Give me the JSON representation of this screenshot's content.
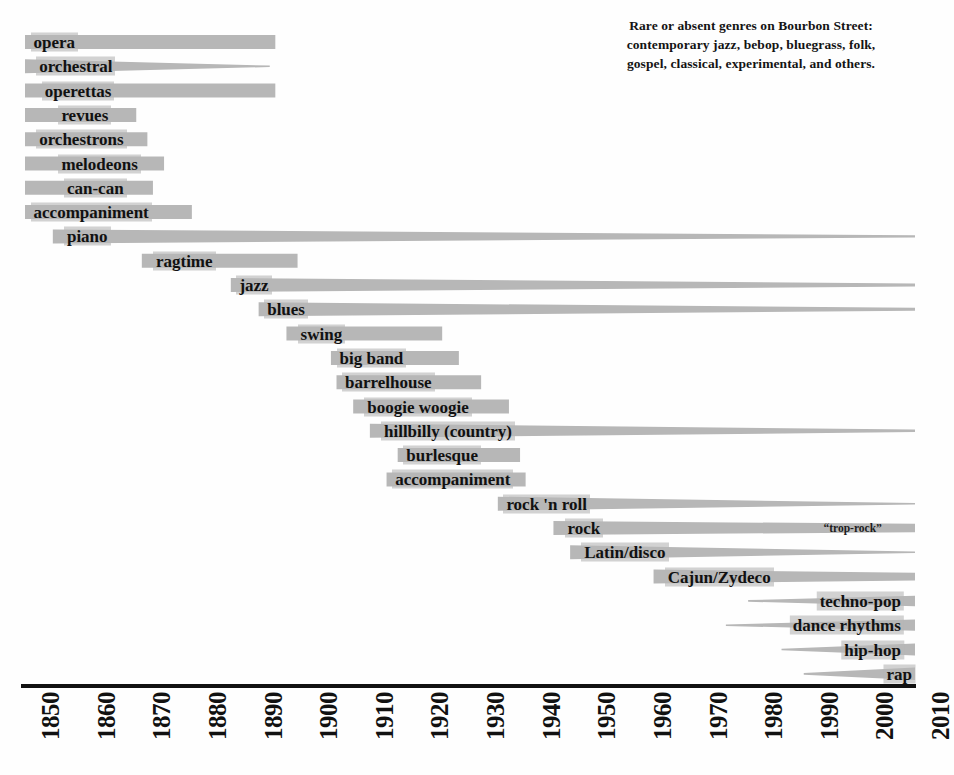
{
  "note": {
    "lines": [
      "Rare or absent genres on Bourbon Street:",
      "contemporary jazz, bebop, bluegrass, folk,",
      "gospel, classical, experimental, and others."
    ]
  },
  "axis": {
    "label": "year",
    "ticks": [
      "1850",
      "1860",
      "1870",
      "1880",
      "1890",
      "1900",
      "1910",
      "1920",
      "1930",
      "1940",
      "1950",
      "1960",
      "1970",
      "1980",
      "1990",
      "2000",
      "2010"
    ],
    "min": 1850,
    "max": 2010
  },
  "colors": {
    "bar": "#b7b7b7",
    "text": "#111111",
    "background": "#fefefe",
    "axis": "#111111"
  },
  "chart_data": {
    "type": "bar",
    "subtype": "timeline-range",
    "xlabel": "year",
    "ylabel": "",
    "xlim": [
      1850,
      2010
    ],
    "grid": false,
    "legend": null,
    "annotations": [
      {
        "text": "“trop-rock”",
        "year": 1993,
        "row": 19
      },
      {
        "text": "Rare or absent genres on Bourbon Street: contemporary jazz, bebop, bluegrass, folk, gospel, classical, experimental, and others.",
        "year": 1985,
        "row": 0
      }
    ],
    "categories": [
      "opera",
      "orchestral",
      "operettas",
      "revues",
      "orchestrons",
      "melodeons",
      "can-can",
      "accompaniment",
      "piano",
      "ragtime",
      "jazz",
      "blues",
      "swing",
      "big band",
      "barrelhouse",
      "boogie woogie",
      "hillbilly (country)",
      "burlesque",
      "accompaniment",
      "rock 'n roll",
      "rock",
      "Latin/disco",
      "Cajun/Zydeco",
      "techno-pop",
      "dance rhythms",
      "hip-hop",
      "rap"
    ],
    "bars": [
      {
        "label": "opera",
        "start": 1850,
        "end": 1895,
        "start_w": 1.0,
        "end_w": 1.0,
        "label_at": "start",
        "label_year": 1851,
        "row": 0
      },
      {
        "label": "orchestral",
        "start": 1850,
        "end": 1894,
        "start_w": 1.0,
        "end_w": 0.1,
        "label_at": "start",
        "label_year": 1852,
        "row": 1
      },
      {
        "label": "operettas",
        "start": 1850,
        "end": 1895,
        "start_w": 1.0,
        "end_w": 1.0,
        "label_at": "start",
        "label_year": 1853,
        "row": 2
      },
      {
        "label": "revues",
        "start": 1850,
        "end": 1870,
        "start_w": 1.0,
        "end_w": 1.0,
        "label_at": "start",
        "label_year": 1856,
        "row": 3
      },
      {
        "label": "orchestrons",
        "start": 1850,
        "end": 1872,
        "start_w": 1.0,
        "end_w": 1.0,
        "label_at": "start",
        "label_year": 1852,
        "row": 4
      },
      {
        "label": "melodeons",
        "start": 1850,
        "end": 1875,
        "start_w": 1.0,
        "end_w": 1.0,
        "label_at": "start",
        "label_year": 1856,
        "row": 5
      },
      {
        "label": "can-can",
        "start": 1850,
        "end": 1873,
        "start_w": 1.0,
        "end_w": 1.0,
        "label_at": "start",
        "label_year": 1857,
        "row": 6
      },
      {
        "label": "accompaniment",
        "start": 1850,
        "end": 1880,
        "start_w": 1.0,
        "end_w": 1.0,
        "label_at": "start",
        "label_year": 1851,
        "row": 7
      },
      {
        "label": "piano",
        "start": 1855,
        "end": 2010,
        "start_w": 1.0,
        "end_w": 0.16,
        "label_at": "start",
        "label_year": 1857,
        "row": 8
      },
      {
        "label": "ragtime",
        "start": 1871,
        "end": 1899,
        "start_w": 1.0,
        "end_w": 1.0,
        "label_at": "start",
        "label_year": 1873,
        "row": 9
      },
      {
        "label": "jazz",
        "start": 1887,
        "end": 2010,
        "start_w": 1.0,
        "end_w": 0.22,
        "label_at": "start",
        "label_year": 1888,
        "row": 10
      },
      {
        "label": "blues",
        "start": 1892,
        "end": 2010,
        "start_w": 1.0,
        "end_w": 0.22,
        "label_at": "start",
        "label_year": 1893,
        "row": 11
      },
      {
        "label": "swing",
        "start": 1897,
        "end": 1925,
        "start_w": 1.0,
        "end_w": 1.0,
        "label_at": "start",
        "label_year": 1899,
        "row": 12
      },
      {
        "label": "big band",
        "start": 1905,
        "end": 1928,
        "start_w": 1.0,
        "end_w": 1.0,
        "label_at": "start",
        "label_year": 1906,
        "row": 13
      },
      {
        "label": "barrelhouse",
        "start": 1906,
        "end": 1932,
        "start_w": 1.0,
        "end_w": 1.0,
        "label_at": "start",
        "label_year": 1907,
        "row": 14
      },
      {
        "label": "boogie woogie",
        "start": 1909,
        "end": 1937,
        "start_w": 1.0,
        "end_w": 1.0,
        "label_at": "start",
        "label_year": 1911,
        "row": 15
      },
      {
        "label": "hillbilly (country)",
        "start": 1912,
        "end": 2010,
        "start_w": 1.0,
        "end_w": 0.18,
        "label_at": "start",
        "label_year": 1914,
        "row": 16
      },
      {
        "label": "burlesque",
        "start": 1917,
        "end": 1939,
        "start_w": 1.0,
        "end_w": 1.0,
        "label_at": "start",
        "label_year": 1918,
        "row": 17
      },
      {
        "label": "accompaniment",
        "start": 1915,
        "end": 1940,
        "start_w": 1.0,
        "end_w": 1.0,
        "label_at": "start",
        "label_year": 1916,
        "row": 18
      },
      {
        "label": "rock 'n roll",
        "start": 1935,
        "end": 2010,
        "start_w": 1.0,
        "end_w": 0.1,
        "label_at": "start",
        "label_year": 1936,
        "row": 19
      },
      {
        "label": "rock",
        "start": 1945,
        "end": 2010,
        "start_w": 1.0,
        "end_w": 0.6,
        "label_at": "start",
        "label_year": 1947,
        "row": 20
      },
      {
        "label": "Latin/disco",
        "start": 1948,
        "end": 2010,
        "start_w": 1.0,
        "end_w": 0.08,
        "label_at": "start",
        "label_year": 1950,
        "row": 21
      },
      {
        "label": "Cajun/Zydeco",
        "start": 1963,
        "end": 2010,
        "start_w": 1.0,
        "end_w": 0.55,
        "label_at": "start",
        "label_year": 1965,
        "row": 22
      },
      {
        "label": "techno-pop",
        "start": 1980,
        "end": 2010,
        "start_w": 0.12,
        "end_w": 0.75,
        "label_at": "end",
        "label_year": 2008,
        "row": 23
      },
      {
        "label": "dance rhythms",
        "start": 1976,
        "end": 2010,
        "start_w": 0.1,
        "end_w": 0.8,
        "label_at": "end",
        "label_year": 2008,
        "row": 24
      },
      {
        "label": "hip-hop",
        "start": 1986,
        "end": 2010,
        "start_w": 0.1,
        "end_w": 0.85,
        "label_at": "end",
        "label_year": 2008,
        "row": 25
      },
      {
        "label": "rap",
        "start": 1990,
        "end": 2010,
        "start_w": 0.12,
        "end_w": 0.9,
        "label_at": "end",
        "label_year": 2010,
        "row": 26
      }
    ]
  }
}
